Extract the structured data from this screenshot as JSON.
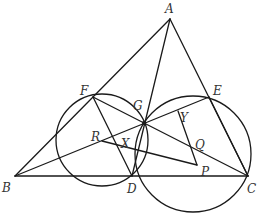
{
  "diagram": {
    "type": "geometry",
    "stroke_color": "#1a1a1a",
    "label_color": "#333333",
    "points": {
      "A": {
        "label": "A",
        "x": 170,
        "y": 19
      },
      "B": {
        "label": "B",
        "x": 15,
        "y": 176
      },
      "C": {
        "label": "C",
        "x": 248,
        "y": 176
      },
      "D": {
        "label": "D",
        "x": 132,
        "y": 176
      },
      "E": {
        "label": "E",
        "x": 209,
        "y": 97
      },
      "F": {
        "label": "F",
        "x": 93,
        "y": 97
      },
      "G": {
        "label": "G",
        "x": 144,
        "y": 123
      },
      "P": {
        "label": "P",
        "x": 197,
        "y": 165
      },
      "Q": {
        "label": "Q",
        "x": 191,
        "y": 148
      },
      "R": {
        "label": "R",
        "x": 102,
        "y": 141
      },
      "X": {
        "label": "X",
        "x": 131,
        "y": 152
      },
      "Y": {
        "label": "Y",
        "x": 178,
        "y": 111
      }
    },
    "labels": {
      "A": "A",
      "B": "B",
      "C": "C",
      "D": "D",
      "E": "E",
      "F": "F",
      "G": "G",
      "P": "P",
      "Q": "Q",
      "R": "R",
      "X": "X",
      "Y": "Y"
    },
    "segments": [
      [
        "A",
        "B"
      ],
      [
        "A",
        "C"
      ],
      [
        "B",
        "C"
      ],
      [
        "A",
        "D"
      ],
      [
        "F",
        "D"
      ],
      [
        "E",
        "C"
      ],
      [
        "B",
        "E"
      ],
      [
        "F",
        "C"
      ],
      [
        "R",
        "P"
      ],
      [
        "Y",
        "P"
      ]
    ],
    "circles": [
      {
        "name": "circle-BDF",
        "cx": 102,
        "cy": 140,
        "r": 46
      },
      {
        "name": "circle-CDE",
        "cx": 193,
        "cy": 154,
        "r": 58
      }
    ]
  }
}
